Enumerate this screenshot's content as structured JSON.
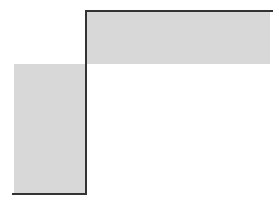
{
  "diagram": {
    "colors": {
      "fill": "#d8d8d8",
      "line": "#333333",
      "background": "#ffffff"
    },
    "regions": [
      {
        "name": "upper-right-band",
        "x": 87,
        "y": 12,
        "w": 183,
        "h": 52
      },
      {
        "name": "lower-left-block",
        "x": 14,
        "y": 64,
        "w": 71,
        "h": 129
      }
    ],
    "boundary": [
      {
        "name": "top-edge",
        "x": 85,
        "y": 10,
        "w": 188,
        "h": 2
      },
      {
        "name": "vertical-edge",
        "x": 85,
        "y": 10,
        "w": 2,
        "h": 185
      },
      {
        "name": "bottom-edge",
        "x": 12,
        "y": 193,
        "w": 75,
        "h": 2
      }
    ]
  }
}
